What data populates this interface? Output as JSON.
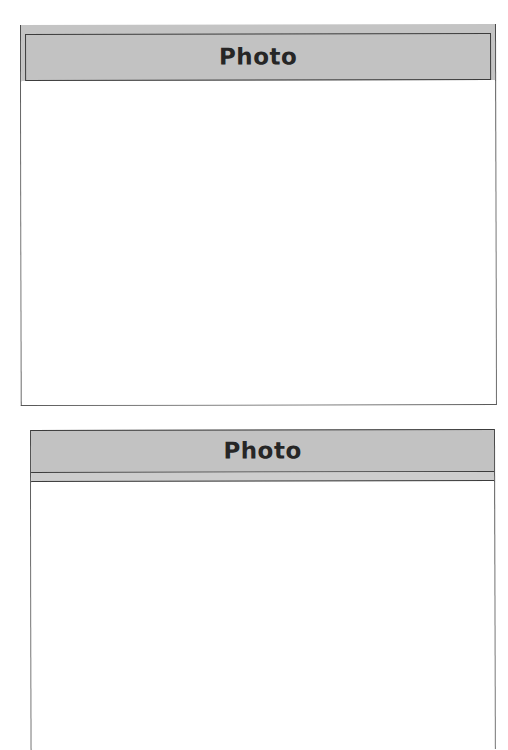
{
  "page": {
    "background": "#ffffff"
  },
  "frames": [
    {
      "header": {
        "title": "Photo",
        "fill_color": "#c2c2c2",
        "border_color": "#3c3c3c"
      },
      "photo_area": {
        "content": ""
      }
    },
    {
      "header": {
        "title": "Photo",
        "fill_color": "#c2c2c2",
        "border_color": "#3c3c3c"
      },
      "photo_area": {
        "content": ""
      }
    }
  ]
}
